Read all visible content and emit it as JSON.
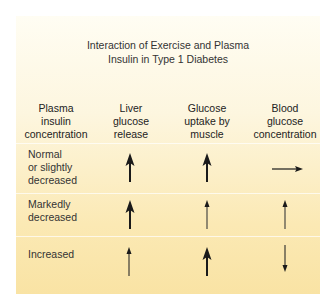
{
  "title": {
    "line1": "Interaction of Exercise and Plasma",
    "line2": "Insulin in Type 1 Diabetes"
  },
  "headers": [
    {
      "lines": [
        "Plasma",
        "insulin",
        "concentration"
      ]
    },
    {
      "lines": [
        "Liver",
        "glucose",
        "release"
      ]
    },
    {
      "lines": [
        "Glucose",
        "uptake by",
        "muscle"
      ]
    },
    {
      "lines": [
        "Blood",
        "glucose",
        "concentration"
      ]
    }
  ],
  "rows": [
    {
      "label": [
        "Normal",
        "or slightly",
        "decreased"
      ],
      "liver_glucose_release": "large-increase",
      "glucose_uptake_by_muscle": "large-increase",
      "blood_glucose_concentration": "no-change"
    },
    {
      "label": [
        "Markedly",
        "decreased"
      ],
      "liver_glucose_release": "large-increase",
      "glucose_uptake_by_muscle": "small-increase",
      "blood_glucose_concentration": "small-increase"
    },
    {
      "label": [
        "Increased"
      ],
      "liver_glucose_release": "small-increase",
      "glucose_uptake_by_muscle": "large-increase",
      "blood_glucose_concentration": "decrease"
    }
  ],
  "legend_icons": {
    "large-increase": "thick-up-arrow-icon",
    "small-increase": "thin-up-arrow-icon",
    "decrease": "thin-down-arrow-icon",
    "no-change": "right-arrow-icon"
  },
  "colors": {
    "background_top": "#fffdf3",
    "background_bottom": "#f9e3a4",
    "arrow": "#1a1a1a",
    "text": "#333333"
  }
}
